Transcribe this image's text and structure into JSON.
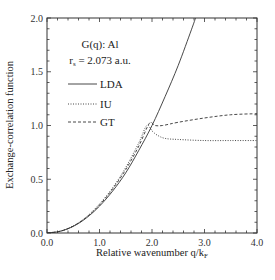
{
  "chart_data": {
    "type": "line",
    "title": "",
    "annotation": {
      "line1": "G(q): Al",
      "line2_prefix": "r",
      "line2_sub": "s",
      "line2_suffix": " = 2.073 a.u."
    },
    "xlabel": "Relative wavenumber q/k",
    "xlabel_sub": "F",
    "ylabel": "Exchange-correlation function",
    "xlim": [
      0.0,
      4.0
    ],
    "ylim": [
      0.0,
      2.0
    ],
    "xticks": [
      "0.0",
      "1.0",
      "2.0",
      "3.0",
      "4.0"
    ],
    "yticks": [
      "0.0",
      "0.5",
      "1.0",
      "1.5",
      "2.0"
    ],
    "grid": false,
    "legend_position": "upper-left",
    "series": [
      {
        "name": "LDA",
        "style": "solid",
        "x": [
          0.0,
          0.25,
          0.5,
          0.75,
          1.0,
          1.25,
          1.5,
          1.75,
          2.0,
          2.25,
          2.5,
          2.75,
          2.83
        ],
        "y": [
          0.0,
          0.016,
          0.062,
          0.14,
          0.25,
          0.39,
          0.56,
          0.77,
          1.0,
          1.27,
          1.56,
          1.89,
          2.0
        ]
      },
      {
        "name": "IU",
        "style": "dotted",
        "x": [
          0.0,
          0.25,
          0.5,
          0.75,
          1.0,
          1.25,
          1.5,
          1.75,
          1.9,
          2.0,
          2.1,
          2.25,
          2.5,
          3.0,
          3.5,
          4.0
        ],
        "y": [
          0.0,
          0.017,
          0.066,
          0.15,
          0.27,
          0.42,
          0.61,
          0.84,
          1.0,
          0.95,
          0.91,
          0.88,
          0.87,
          0.86,
          0.86,
          0.86
        ]
      },
      {
        "name": "GT",
        "style": "dashed",
        "x": [
          0.0,
          0.25,
          0.5,
          0.75,
          1.0,
          1.25,
          1.5,
          1.75,
          1.95,
          2.05,
          2.2,
          2.5,
          3.0,
          3.5,
          4.0
        ],
        "y": [
          0.0,
          0.016,
          0.064,
          0.145,
          0.26,
          0.41,
          0.59,
          0.81,
          1.02,
          1.0,
          1.0,
          1.03,
          1.07,
          1.1,
          1.11
        ]
      }
    ]
  }
}
